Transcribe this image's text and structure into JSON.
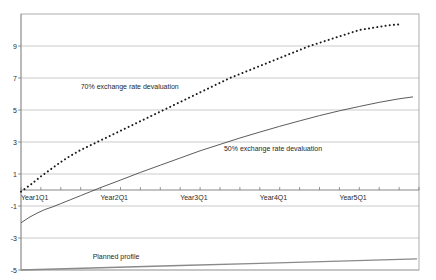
{
  "chart_data": {
    "type": "line",
    "title": "",
    "xlabel": "",
    "ylabel": "",
    "grid": true,
    "legend_position": "inline-annotations",
    "xlim": [
      0,
      20
    ],
    "ylim": [
      -5,
      11
    ],
    "y_ticks": [
      9,
      7,
      5,
      3,
      1,
      -1,
      -3,
      -5
    ],
    "y_tick_labels": [
      "9",
      "7",
      "5",
      "3",
      "1",
      "-1",
      "-3",
      "-5"
    ],
    "x_tick_labels": [
      "Year1Q1",
      "Year2Q1",
      "Year3Q1",
      "Year4Q1",
      "Year5Q1"
    ],
    "x_tick_positions": [
      0,
      4,
      8,
      12,
      16
    ],
    "x_minor_ticks": [
      0,
      1,
      2,
      3,
      4,
      5,
      6,
      7,
      8,
      9,
      10,
      11,
      12,
      13,
      14,
      15,
      16,
      17,
      18,
      19,
      20
    ],
    "series": [
      {
        "name": "70% exchange rate devaluation",
        "style": "dotted",
        "color": "#1c1c1c",
        "x": [
          0,
          0.5,
          1,
          1.5,
          2,
          2.5,
          3,
          3.5,
          4,
          4.5,
          5,
          5.5,
          6,
          6.5,
          7,
          7.5,
          8,
          8.5,
          9,
          9.5,
          10,
          10.5,
          11,
          11.5,
          12,
          12.5,
          13,
          13.5,
          14,
          14.5,
          15,
          15.5,
          16,
          16.5,
          17,
          17.5,
          18,
          18.5,
          19
        ],
        "values": [
          -0.1,
          0.35,
          0.85,
          1.3,
          1.75,
          2.15,
          2.5,
          2.8,
          3.1,
          3.4,
          3.7,
          4.0,
          4.3,
          4.6,
          4.9,
          5.2,
          5.5,
          5.8,
          6.1,
          6.4,
          6.7,
          7.0,
          7.25,
          7.5,
          7.75,
          8.0,
          8.25,
          8.5,
          8.75,
          9.0,
          9.2,
          9.4,
          9.6,
          9.8,
          10.0,
          10.1,
          10.2,
          10.3,
          10.35
        ]
      },
      {
        "name": "50% exchange rate devaluation",
        "style": "solid",
        "color": "#4a4a4a",
        "x": [
          0,
          0.4,
          0.8,
          1.2,
          1.6,
          2,
          2.5,
          3,
          3.5,
          4,
          5,
          6,
          7,
          8,
          9,
          10,
          11,
          12,
          13,
          14,
          15,
          16,
          17,
          18,
          19,
          19.7
        ],
        "values": [
          -2.05,
          -1.72,
          -1.45,
          -1.22,
          -1.05,
          -0.85,
          -0.6,
          -0.35,
          -0.1,
          0.15,
          0.62,
          1.1,
          1.55,
          2.0,
          2.45,
          2.85,
          3.25,
          3.62,
          3.98,
          4.32,
          4.65,
          4.95,
          5.22,
          5.48,
          5.7,
          5.82
        ]
      },
      {
        "name": "Planned profile",
        "style": "solid-thick",
        "color": "#8a8a8a",
        "x": [
          0,
          4,
          8,
          12,
          16,
          19.9
        ],
        "values": [
          -5.0,
          -4.86,
          -4.72,
          -4.58,
          -4.44,
          -4.3
        ]
      }
    ],
    "annotations": [
      {
        "text": "70% exchange rate devaluation",
        "x": 3.0,
        "y": 6.3
      },
      {
        "text": "50% exchange rate devaluation",
        "x": 10.2,
        "y": 2.45
      },
      {
        "text": "Planned profile",
        "x": 3.6,
        "y": -4.3
      }
    ]
  }
}
